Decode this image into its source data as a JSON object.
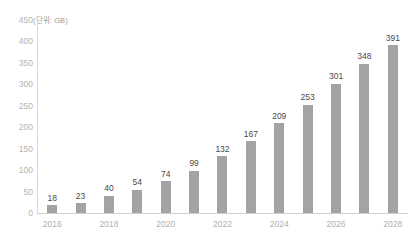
{
  "unit_caption": "(단위: GB)",
  "colors": {
    "bar": "#a3a3a3",
    "value_label": "#4a4a4a",
    "tick_label": "#b4b4b4",
    "axis_line": "#d8d8d8",
    "background": "#ffffff"
  },
  "chart_data": {
    "type": "bar",
    "title": "",
    "subtitle": "",
    "xlabel": "",
    "ylabel": "",
    "unit": "(단위: GB)",
    "categories": [
      "2016",
      "2017",
      "2018",
      "2019",
      "2020",
      "2021",
      "2022",
      "2023",
      "2024",
      "2025",
      "2026",
      "2027",
      "2028"
    ],
    "values": [
      18,
      23,
      40,
      54,
      74,
      99,
      132,
      167,
      209,
      253,
      301,
      348,
      391
    ],
    "data_labels": [
      "18",
      "23",
      "40",
      "54",
      "74",
      "99",
      "132",
      "167",
      "209",
      "253",
      "301",
      "348",
      "391"
    ],
    "x_tick_labels": [
      "2016",
      "2018",
      "2020",
      "2022",
      "2024",
      "2026",
      "2028"
    ],
    "x_tick_indices": [
      0,
      2,
      4,
      6,
      8,
      10,
      12
    ],
    "y_tick_labels": [
      "450",
      "400",
      "350",
      "300",
      "250",
      "200",
      "150",
      "100",
      "50",
      "0"
    ],
    "y_tick_values": [
      450,
      400,
      350,
      300,
      250,
      200,
      150,
      100,
      50,
      0
    ],
    "ylim": [
      0,
      450
    ],
    "grid": false,
    "legend": null,
    "legend_position": "none",
    "annotations": []
  }
}
